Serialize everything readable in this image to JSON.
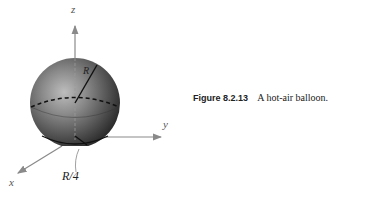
{
  "figure": {
    "axes": {
      "z_label": "z",
      "y_label": "y",
      "x_label": "x"
    },
    "labels": {
      "radius": "R",
      "offset": "R/4"
    },
    "colors": {
      "axis": "#8a8a8a",
      "sphere_dark": "#2a2a2a",
      "sphere_light": "#b0b0b0",
      "line": "#111111"
    }
  },
  "caption": {
    "number": "Figure 8.2.13",
    "text": "A hot-air balloon."
  }
}
